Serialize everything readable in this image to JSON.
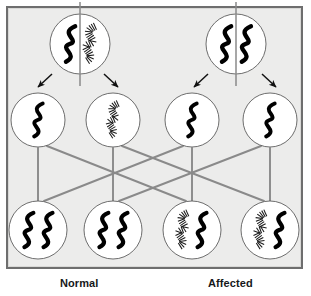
{
  "figure": {
    "background_color": "#ececeb",
    "frame_color": "#6e6e6e",
    "line_color": "#8a8a8a",
    "chromosome_solid_color": "#000000",
    "chromosome_hatched_color": "#1a1a1a"
  },
  "labels": {
    "normal": "Normal",
    "affected": "Affected"
  },
  "legend": {
    "solid_meaning": "normal allele chromosome (solid black squiggle)",
    "hatched_meaning": "mutant allele chromosome (hatched squiggle)"
  },
  "parents": [
    {
      "id": "parent-normal",
      "name": "Normal parent",
      "cx": 80,
      "cy": 44,
      "r": 30,
      "divider": true,
      "chromosomes": [
        {
          "slot": "left",
          "style": "solid"
        },
        {
          "slot": "right",
          "style": "hatched"
        }
      ]
    },
    {
      "id": "parent-affected",
      "name": "Affected parent",
      "cx": 236,
      "cy": 44,
      "r": 30,
      "divider": true,
      "chromosomes": [
        {
          "slot": "left",
          "style": "solid"
        },
        {
          "slot": "right",
          "style": "solid"
        }
      ]
    }
  ],
  "arrows": [
    {
      "id": "arrow-normal-left",
      "from": "parent-normal",
      "to": "gamete-1",
      "direction": "down-left",
      "x1": 52,
      "y1": 74,
      "x2": 38,
      "y2": 87
    },
    {
      "id": "arrow-normal-right",
      "from": "parent-normal",
      "to": "gamete-2",
      "direction": "down-right",
      "x1": 104,
      "y1": 74,
      "x2": 118,
      "y2": 87
    },
    {
      "id": "arrow-affected-left",
      "from": "parent-affected",
      "to": "gamete-3",
      "direction": "down-left",
      "x1": 208,
      "y1": 74,
      "x2": 194,
      "y2": 87
    },
    {
      "id": "arrow-affected-right",
      "from": "parent-affected",
      "to": "gamete-4",
      "direction": "down-right",
      "x1": 262,
      "y1": 74,
      "x2": 276,
      "y2": 87
    }
  ],
  "gametes": [
    {
      "id": "gamete-1",
      "name": "gamete-normal-solid",
      "cx": 38,
      "cy": 120,
      "r": 27,
      "chromosomes": [
        {
          "slot": "center",
          "style": "solid"
        }
      ]
    },
    {
      "id": "gamete-2",
      "name": "gamete-normal-hatched",
      "cx": 113,
      "cy": 120,
      "r": 27,
      "chromosomes": [
        {
          "slot": "center",
          "style": "hatched"
        }
      ]
    },
    {
      "id": "gamete-3",
      "name": "gamete-affected-solid-a",
      "cx": 192,
      "cy": 120,
      "r": 27,
      "chromosomes": [
        {
          "slot": "center",
          "style": "solid"
        }
      ]
    },
    {
      "id": "gamete-4",
      "name": "gamete-affected-solid-b",
      "cx": 270,
      "cy": 120,
      "r": 27,
      "chromosomes": [
        {
          "slot": "center",
          "style": "solid"
        }
      ]
    }
  ],
  "zygotes": [
    {
      "id": "zygote-1",
      "name": "offspring-normal-a",
      "cx": 38,
      "cy": 230,
      "r": 29,
      "chromosomes": [
        {
          "slot": "left",
          "style": "solid"
        },
        {
          "slot": "right",
          "style": "solid"
        }
      ]
    },
    {
      "id": "zygote-2",
      "name": "offspring-normal-b",
      "cx": 113,
      "cy": 230,
      "r": 29,
      "chromosomes": [
        {
          "slot": "left",
          "style": "solid"
        },
        {
          "slot": "right",
          "style": "solid"
        }
      ]
    },
    {
      "id": "zygote-3",
      "name": "offspring-affected-a",
      "cx": 192,
      "cy": 230,
      "r": 29,
      "chromosomes": [
        {
          "slot": "left",
          "style": "hatched"
        },
        {
          "slot": "right",
          "style": "solid"
        }
      ]
    },
    {
      "id": "zygote-4",
      "name": "offspring-affected-b",
      "cx": 270,
      "cy": 230,
      "r": 29,
      "chromosomes": [
        {
          "slot": "left",
          "style": "hatched"
        },
        {
          "slot": "right",
          "style": "solid"
        }
      ]
    }
  ],
  "connections": [
    {
      "id": "conn-1",
      "from": "gamete-1",
      "to": "zygote-1",
      "x1": 38,
      "y1": 148,
      "x2": 38,
      "y2": 201
    },
    {
      "id": "conn-2",
      "from": "gamete-1",
      "to": "zygote-3",
      "x1": 47,
      "y1": 146,
      "x2": 186,
      "y2": 201
    },
    {
      "id": "conn-3",
      "from": "gamete-2",
      "to": "zygote-2",
      "x1": 113,
      "y1": 148,
      "x2": 113,
      "y2": 201
    },
    {
      "id": "conn-4",
      "from": "gamete-2",
      "to": "zygote-4",
      "x1": 122,
      "y1": 146,
      "x2": 264,
      "y2": 201
    },
    {
      "id": "conn-5",
      "from": "gamete-3",
      "to": "zygote-3",
      "x1": 192,
      "y1": 148,
      "x2": 192,
      "y2": 201
    },
    {
      "id": "conn-6",
      "from": "gamete-3",
      "to": "zygote-1",
      "x1": 183,
      "y1": 146,
      "x2": 44,
      "y2": 201
    },
    {
      "id": "conn-7",
      "from": "gamete-4",
      "to": "zygote-4",
      "x1": 270,
      "y1": 148,
      "x2": 270,
      "y2": 201
    },
    {
      "id": "conn-8",
      "from": "gamete-4",
      "to": "zygote-2",
      "x1": 261,
      "y1": 146,
      "x2": 119,
      "y2": 201
    }
  ]
}
